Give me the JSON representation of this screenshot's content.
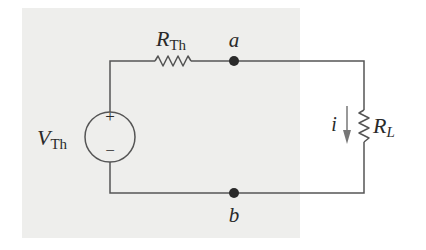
{
  "diagram": {
    "type": "circuit",
    "colors": {
      "wire": "#555555",
      "node": "#2a2a2a",
      "arrow": "#777777",
      "shaded_box": "#eeeeec",
      "background": "#ffffff"
    },
    "source": {
      "label_main": "V",
      "label_sub": "Th",
      "plus_symbol": "+",
      "minus_symbol": "−"
    },
    "series_resistor": {
      "label_main": "R",
      "label_sub": "Th"
    },
    "load_resistor": {
      "label_main": "R",
      "label_sub": "L"
    },
    "current": {
      "label": "i",
      "direction": "down"
    },
    "nodes": [
      {
        "label": "a"
      },
      {
        "label": "b"
      }
    ]
  }
}
